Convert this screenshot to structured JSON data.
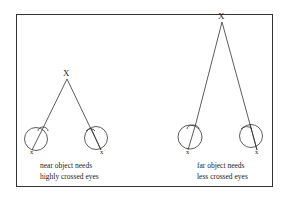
{
  "diagram": {
    "panels": [
      {
        "id": "near",
        "object_label": "X",
        "eye_labels": [
          "x",
          "x"
        ],
        "caption": [
          "near object needs",
          "highly crossed eyes"
        ]
      },
      {
        "id": "far",
        "object_label": "X",
        "eye_labels": [
          "x",
          "x"
        ],
        "caption": [
          "far object needs",
          "less crossed eyes"
        ]
      }
    ],
    "stroke_color": "#333333"
  }
}
